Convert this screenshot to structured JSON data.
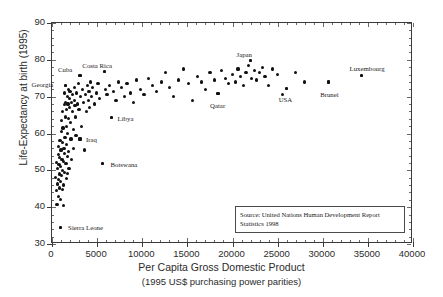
{
  "chart_data": {
    "type": "scatter",
    "title": "",
    "xlabel": "Per Capita Gross Domestic Product",
    "xsublabel": "(1995 US$ purchasing power parities)",
    "ylabel": "Life-Expectancy at birth (1995)",
    "xlim": [
      0,
      40000
    ],
    "ylim": [
      30,
      90
    ],
    "xticks": [
      0,
      5000,
      10000,
      15000,
      20000,
      25000,
      30000,
      35000,
      40000
    ],
    "xtick_labels": [
      "0",
      "5000",
      "10000",
      "15000",
      "20000",
      "25000",
      "30000",
      "35000",
      "40000"
    ],
    "yticks": [
      30,
      40,
      50,
      60,
      70,
      80,
      90
    ],
    "ytick_labels": [
      "30",
      "40",
      "50",
      "60",
      "70",
      "80",
      "90"
    ],
    "grid": false,
    "legend": null,
    "marker": "filled-circle",
    "marker_color": "#111111",
    "source_note_line1": "Source: United Nations Human Development Report",
    "source_note_line2": "Statistics 1998",
    "annotations": [
      {
        "label": "Cuba",
        "x": 3100,
        "y": 75.7,
        "dx": -22,
        "dy": -10
      },
      {
        "label": "Costa Rica",
        "x": 5800,
        "y": 76.8,
        "dx": -22,
        "dy": -10
      },
      {
        "label": "Georgia",
        "x": 1500,
        "y": 73.0,
        "dx": -34,
        "dy": -5
      },
      {
        "label": "Libya",
        "x": 6600,
        "y": 64.3,
        "dx": 6,
        "dy": -3
      },
      {
        "label": "Iraq",
        "x": 3100,
        "y": 58.5,
        "dx": 6,
        "dy": -3
      },
      {
        "label": "Botswana",
        "x": 5600,
        "y": 51.8,
        "dx": 8,
        "dy": -3
      },
      {
        "label": "Sierra Leone",
        "x": 900,
        "y": 34.5,
        "dx": 8,
        "dy": -3
      },
      {
        "label": "Japan",
        "x": 22000,
        "y": 79.8,
        "dx": -14,
        "dy": -10
      },
      {
        "label": "Qatar",
        "x": 18400,
        "y": 70.8,
        "dx": -8,
        "dy": 8
      },
      {
        "label": "USA",
        "x": 26000,
        "y": 72.3,
        "dx": -8,
        "dy": 8
      },
      {
        "label": "Brunei",
        "x": 30600,
        "y": 74.0,
        "dx": -8,
        "dy": 9
      },
      {
        "label": "Luxembourg",
        "x": 34300,
        "y": 75.8,
        "dx": -12,
        "dy": -10
      }
    ],
    "points": [
      {
        "x": 420,
        "y": 48.0
      },
      {
        "x": 480,
        "y": 44.5
      },
      {
        "x": 520,
        "y": 52.2
      },
      {
        "x": 560,
        "y": 40.7
      },
      {
        "x": 600,
        "y": 46.3
      },
      {
        "x": 640,
        "y": 50.6
      },
      {
        "x": 680,
        "y": 54.4
      },
      {
        "x": 700,
        "y": 47.5
      },
      {
        "x": 720,
        "y": 43.0
      },
      {
        "x": 760,
        "y": 56.5
      },
      {
        "x": 780,
        "y": 51.5
      },
      {
        "x": 800,
        "y": 45.2
      },
      {
        "x": 820,
        "y": 49.0
      },
      {
        "x": 850,
        "y": 53.5
      },
      {
        "x": 880,
        "y": 58.0
      },
      {
        "x": 900,
        "y": 34.5
      },
      {
        "x": 920,
        "y": 42.0
      },
      {
        "x": 950,
        "y": 47.0
      },
      {
        "x": 980,
        "y": 51.0
      },
      {
        "x": 1000,
        "y": 55.5
      },
      {
        "x": 1020,
        "y": 60.5
      },
      {
        "x": 1050,
        "y": 63.5
      },
      {
        "x": 1080,
        "y": 48.5
      },
      {
        "x": 1100,
        "y": 53.0
      },
      {
        "x": 1120,
        "y": 57.5
      },
      {
        "x": 1150,
        "y": 44.8
      },
      {
        "x": 1180,
        "y": 50.0
      },
      {
        "x": 1200,
        "y": 66.0
      },
      {
        "x": 1220,
        "y": 61.5
      },
      {
        "x": 1250,
        "y": 52.5
      },
      {
        "x": 1280,
        "y": 46.0
      },
      {
        "x": 1300,
        "y": 40.5
      },
      {
        "x": 1320,
        "y": 56.0
      },
      {
        "x": 1350,
        "y": 67.8
      },
      {
        "x": 1380,
        "y": 71.0
      },
      {
        "x": 1400,
        "y": 49.5
      },
      {
        "x": 1420,
        "y": 54.5
      },
      {
        "x": 1450,
        "y": 59.0
      },
      {
        "x": 1480,
        "y": 64.5
      },
      {
        "x": 1500,
        "y": 73.0
      },
      {
        "x": 1520,
        "y": 68.5
      },
      {
        "x": 1550,
        "y": 51.8
      },
      {
        "x": 1580,
        "y": 47.8
      },
      {
        "x": 1600,
        "y": 57.0
      },
      {
        "x": 1620,
        "y": 62.0
      },
      {
        "x": 1650,
        "y": 66.5
      },
      {
        "x": 1680,
        "y": 70.0
      },
      {
        "x": 1700,
        "y": 53.8
      },
      {
        "x": 1720,
        "y": 49.2
      },
      {
        "x": 1750,
        "y": 60.0
      },
      {
        "x": 1780,
        "y": 68.0
      },
      {
        "x": 1800,
        "y": 72.0
      },
      {
        "x": 1820,
        "y": 64.0
      },
      {
        "x": 1850,
        "y": 55.2
      },
      {
        "x": 1880,
        "y": 50.5
      },
      {
        "x": 1900,
        "y": 67.0
      },
      {
        "x": 1950,
        "y": 69.5
      },
      {
        "x": 2000,
        "y": 71.5
      },
      {
        "x": 2050,
        "y": 63.0
      },
      {
        "x": 2100,
        "y": 58.5
      },
      {
        "x": 2150,
        "y": 53.0
      },
      {
        "x": 2200,
        "y": 68.5
      },
      {
        "x": 2250,
        "y": 70.5
      },
      {
        "x": 2300,
        "y": 66.0
      },
      {
        "x": 2350,
        "y": 61.0
      },
      {
        "x": 2400,
        "y": 56.0
      },
      {
        "x": 2450,
        "y": 72.5
      },
      {
        "x": 2500,
        "y": 69.0
      },
      {
        "x": 2550,
        "y": 67.5
      },
      {
        "x": 2600,
        "y": 64.5
      },
      {
        "x": 2650,
        "y": 59.5
      },
      {
        "x": 2700,
        "y": 71.0
      },
      {
        "x": 2800,
        "y": 68.0
      },
      {
        "x": 2900,
        "y": 73.5
      },
      {
        "x": 3000,
        "y": 66.5
      },
      {
        "x": 3100,
        "y": 75.7
      },
      {
        "x": 3100,
        "y": 58.5
      },
      {
        "x": 3200,
        "y": 70.0
      },
      {
        "x": 3300,
        "y": 62.0
      },
      {
        "x": 3400,
        "y": 72.0
      },
      {
        "x": 3500,
        "y": 68.5
      },
      {
        "x": 3600,
        "y": 55.5
      },
      {
        "x": 3700,
        "y": 70.5
      },
      {
        "x": 3800,
        "y": 66.0
      },
      {
        "x": 3900,
        "y": 73.0
      },
      {
        "x": 4000,
        "y": 69.0
      },
      {
        "x": 4100,
        "y": 71.5
      },
      {
        "x": 4200,
        "y": 67.0
      },
      {
        "x": 4300,
        "y": 74.0
      },
      {
        "x": 4400,
        "y": 70.0
      },
      {
        "x": 4500,
        "y": 72.5
      },
      {
        "x": 4700,
        "y": 68.0
      },
      {
        "x": 4900,
        "y": 71.0
      },
      {
        "x": 5100,
        "y": 73.5
      },
      {
        "x": 5300,
        "y": 69.5
      },
      {
        "x": 5600,
        "y": 51.8
      },
      {
        "x": 5800,
        "y": 76.8
      },
      {
        "x": 5900,
        "y": 72.0
      },
      {
        "x": 6100,
        "y": 70.5
      },
      {
        "x": 6400,
        "y": 73.0
      },
      {
        "x": 6600,
        "y": 64.3
      },
      {
        "x": 6800,
        "y": 71.5
      },
      {
        "x": 7100,
        "y": 69.0
      },
      {
        "x": 7400,
        "y": 74.0
      },
      {
        "x": 7700,
        "y": 72.5
      },
      {
        "x": 8000,
        "y": 70.0
      },
      {
        "x": 8300,
        "y": 73.5
      },
      {
        "x": 8700,
        "y": 71.0
      },
      {
        "x": 9000,
        "y": 68.5
      },
      {
        "x": 9400,
        "y": 74.5
      },
      {
        "x": 9800,
        "y": 72.0
      },
      {
        "x": 10200,
        "y": 70.5
      },
      {
        "x": 10700,
        "y": 75.0
      },
      {
        "x": 11100,
        "y": 73.0
      },
      {
        "x": 11600,
        "y": 71.5
      },
      {
        "x": 12100,
        "y": 74.0
      },
      {
        "x": 12600,
        "y": 76.5
      },
      {
        "x": 13000,
        "y": 72.5
      },
      {
        "x": 13500,
        "y": 70.0
      },
      {
        "x": 14000,
        "y": 74.5
      },
      {
        "x": 14600,
        "y": 77.5
      },
      {
        "x": 15100,
        "y": 73.5
      },
      {
        "x": 15600,
        "y": 69.0
      },
      {
        "x": 16100,
        "y": 75.5
      },
      {
        "x": 16600,
        "y": 74.0
      },
      {
        "x": 17000,
        "y": 72.0
      },
      {
        "x": 17500,
        "y": 76.5
      },
      {
        "x": 18000,
        "y": 74.5
      },
      {
        "x": 18400,
        "y": 70.8
      },
      {
        "x": 18800,
        "y": 77.0
      },
      {
        "x": 19200,
        "y": 75.0
      },
      {
        "x": 19600,
        "y": 73.5
      },
      {
        "x": 20000,
        "y": 76.0
      },
      {
        "x": 20300,
        "y": 74.0
      },
      {
        "x": 20600,
        "y": 77.5
      },
      {
        "x": 20900,
        "y": 75.5
      },
      {
        "x": 21200,
        "y": 73.0
      },
      {
        "x": 21500,
        "y": 76.5
      },
      {
        "x": 21800,
        "y": 78.5
      },
      {
        "x": 22000,
        "y": 79.8
      },
      {
        "x": 22100,
        "y": 75.0
      },
      {
        "x": 22400,
        "y": 77.0
      },
      {
        "x": 22700,
        "y": 74.5
      },
      {
        "x": 23000,
        "y": 76.5
      },
      {
        "x": 23300,
        "y": 78.0
      },
      {
        "x": 23600,
        "y": 75.5
      },
      {
        "x": 24000,
        "y": 73.0
      },
      {
        "x": 24400,
        "y": 77.5
      },
      {
        "x": 25000,
        "y": 76.0
      },
      {
        "x": 25500,
        "y": 70.5
      },
      {
        "x": 26000,
        "y": 72.3
      },
      {
        "x": 27000,
        "y": 76.5
      },
      {
        "x": 28000,
        "y": 74.0
      },
      {
        "x": 30600,
        "y": 74.0
      },
      {
        "x": 34300,
        "y": 75.8
      }
    ]
  }
}
